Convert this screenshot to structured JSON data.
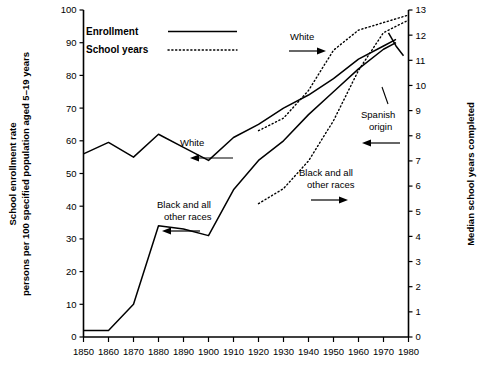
{
  "axes": {
    "left_label_line1": "School enrollment rate",
    "left_label_line2": "persons per 100 specified population aged 5–19 years",
    "right_label": "Median school years completed",
    "left_ticks": [
      "0",
      "10",
      "20",
      "30",
      "40",
      "50",
      "60",
      "70",
      "80",
      "90",
      "100"
    ],
    "right_ticks": [
      "0",
      "1",
      "2",
      "3",
      "4",
      "5",
      "6",
      "7",
      "8",
      "9",
      "10",
      "11",
      "12",
      "13"
    ],
    "x_ticks": [
      "1850",
      "1860",
      "1870",
      "1880",
      "1890",
      "1900",
      "1910",
      "1920",
      "1930",
      "1940",
      "1950",
      "1960",
      "1970",
      "1980"
    ]
  },
  "legend": {
    "enrollment_label": "Enrollment",
    "school_years_label": "School years"
  },
  "annotations": {
    "white_enrollment": "White",
    "white_school_years": "White",
    "black_enrollment": "Black and all\nother races",
    "black_enrollment_l1": "Black and all",
    "black_enrollment_l2": "other races",
    "black_school_years_l1": "Black and all",
    "black_school_years_l2": "other races",
    "spanish_origin_l1": "Spanish",
    "spanish_origin_l2": "origin"
  },
  "colors": {
    "line": "#000000",
    "background": "#ffffff",
    "axis": "#000000"
  },
  "chart_data": {
    "type": "line",
    "title": "",
    "xlabel": "",
    "ylabel": "School enrollment rate persons per 100 specified population aged 5-19 years",
    "y2label": "Median school years completed",
    "xlim": [
      1850,
      1980
    ],
    "ylim": [
      0,
      100
    ],
    "y2lim": [
      0,
      13
    ],
    "grid": false,
    "legend_position": "top-left",
    "x": [
      1850,
      1860,
      1870,
      1880,
      1890,
      1900,
      1910,
      1920,
      1930,
      1940,
      1950,
      1960,
      1970,
      1980
    ],
    "series": [
      {
        "name": "Enrollment, White",
        "axis": "left",
        "style": "solid",
        "x": [
          1850,
          1860,
          1870,
          1880,
          1890,
          1900,
          1910,
          1920,
          1930,
          1940,
          1950,
          1960,
          1970,
          1975
        ],
        "values": [
          56,
          59.5,
          55,
          62,
          58,
          54,
          61,
          65,
          70,
          74,
          79,
          85,
          89,
          91
        ]
      },
      {
        "name": "Enrollment, Black and all other races",
        "axis": "left",
        "style": "solid",
        "x": [
          1850,
          1860,
          1870,
          1880,
          1890,
          1900,
          1910,
          1920,
          1930,
          1940,
          1950,
          1960,
          1970,
          1975
        ],
        "values": [
          2,
          2,
          10,
          34,
          33,
          31,
          45,
          54,
          60,
          68,
          75,
          82,
          88,
          90
        ]
      },
      {
        "name": "Enrollment, Spanish origin",
        "axis": "left",
        "style": "solid",
        "x": [
          1972,
          1975,
          1978
        ],
        "values": [
          93,
          89,
          86
        ]
      },
      {
        "name": "School years, White",
        "axis": "right",
        "style": "dotted",
        "x": [
          1920,
          1930,
          1940,
          1950,
          1960,
          1970,
          1980
        ],
        "values": [
          8.2,
          8.7,
          9.8,
          11.4,
          12.2,
          12.5,
          12.8
        ]
      },
      {
        "name": "School years, Black and all other races",
        "axis": "right",
        "style": "dotted",
        "x": [
          1920,
          1930,
          1940,
          1950,
          1960,
          1970,
          1980
        ],
        "values": [
          5.3,
          5.9,
          7.0,
          8.6,
          10.6,
          12.1,
          12.6
        ]
      }
    ],
    "annotations": [
      {
        "text": "White",
        "target": "Enrollment, White",
        "arrow": "left"
      },
      {
        "text": "White",
        "target": "School years, White",
        "arrow": "right"
      },
      {
        "text": "Black and all other races",
        "target": "Enrollment, Black and all other races",
        "arrow": "left"
      },
      {
        "text": "Black and all other races",
        "target": "School years, Black and all other races",
        "arrow": "right"
      },
      {
        "text": "Spanish origin",
        "target": "Enrollment, Spanish origin",
        "arrow": "left"
      }
    ]
  }
}
